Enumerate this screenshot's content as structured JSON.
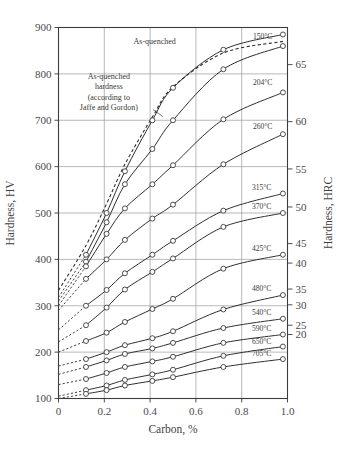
{
  "chart_data": {
    "type": "line",
    "title": "",
    "xlabel": "Carbon, %",
    "ylabel": "Hardness, HV",
    "ylabel_right": "Hardness, HRC",
    "xlim": [
      0,
      1.0
    ],
    "ylim": [
      100,
      900
    ],
    "xticks": [
      "0",
      "0.2",
      "0.4",
      "0.6",
      "0.8",
      "1.0"
    ],
    "xtick_values": [
      0,
      0.2,
      0.4,
      0.6,
      0.8,
      1.0
    ],
    "yticks": [
      "100",
      "200",
      "300",
      "400",
      "500",
      "600",
      "700",
      "800",
      "900"
    ],
    "ytick_values": [
      100,
      200,
      300,
      400,
      500,
      600,
      700,
      800,
      900
    ],
    "yticks_right": [
      "20",
      "25",
      "30",
      "35",
      "40",
      "45",
      "50",
      "55",
      "60",
      "65"
    ],
    "ytick_right_hv": [
      238,
      258,
      302,
      336,
      392,
      434,
      513,
      595,
      697,
      820
    ],
    "grid": true,
    "legend_position": "inline-right-labels",
    "annotations": [
      {
        "name": "as-quenched-top-label",
        "text": "As-quenched",
        "x": 0.42,
        "y": 865
      },
      {
        "name": "jaffe-gordon-note",
        "lines": [
          "As-quenched",
          "hardness",
          "(according to",
          "Jaffe and Gordon)"
        ],
        "x": 0.22,
        "y": 790
      }
    ],
    "series": [
      {
        "name": "As-quenched",
        "label": "As-quenched",
        "style": "solid",
        "x": [
          0.12,
          0.21,
          0.29,
          0.41,
          0.5,
          0.72,
          0.98
        ],
        "values": [
          410,
          500,
          590,
          700,
          770,
          852,
          885
        ],
        "dashed_extension_x": [
          0,
          0.12
        ],
        "dashed_extension_y": [
          318,
          410
        ]
      },
      {
        "name": "As-quenched (Jaffe and Gordon)",
        "label": "",
        "style": "dashed",
        "x": [
          0.0,
          0.12,
          0.21,
          0.29,
          0.41,
          0.5,
          0.72,
          0.98
        ],
        "values": [
          333,
          430,
          520,
          605,
          707,
          772,
          845,
          870
        ]
      },
      {
        "name": "150C",
        "label": "150°C",
        "style": "solid",
        "x": [
          0.12,
          0.21,
          0.29,
          0.41,
          0.5,
          0.72,
          0.98
        ],
        "values": [
          395,
          480,
          562,
          638,
          700,
          810,
          860
        ],
        "dashed_extension_x": [
          0,
          0.12
        ],
        "dashed_extension_y": [
          310,
          395
        ]
      },
      {
        "name": "204C",
        "label": "204°C",
        "style": "solid",
        "x": [
          0.12,
          0.21,
          0.29,
          0.41,
          0.5,
          0.72,
          0.98
        ],
        "values": [
          385,
          455,
          510,
          562,
          603,
          702,
          760
        ],
        "dashed_extension_x": [
          0,
          0.12
        ],
        "dashed_extension_y": [
          300,
          385
        ]
      },
      {
        "name": "260C",
        "label": "260°C",
        "style": "solid",
        "x": [
          0.12,
          0.21,
          0.29,
          0.41,
          0.5,
          0.72,
          0.98
        ],
        "values": [
          358,
          400,
          442,
          488,
          518,
          605,
          670
        ],
        "dashed_extension_x": [
          0,
          0.12
        ],
        "dashed_extension_y": [
          290,
          358
        ]
      },
      {
        "name": "315C",
        "label": "315°C",
        "style": "solid",
        "x": [
          0.12,
          0.21,
          0.29,
          0.41,
          0.5,
          0.72,
          0.98
        ],
        "values": [
          300,
          334,
          370,
          410,
          440,
          505,
          542
        ],
        "dashed_extension_x": [
          0,
          0.12
        ],
        "dashed_extension_y": [
          248,
          300
        ]
      },
      {
        "name": "370C",
        "label": "370°C",
        "style": "solid",
        "x": [
          0.12,
          0.21,
          0.29,
          0.41,
          0.5,
          0.72,
          0.98
        ],
        "values": [
          258,
          296,
          335,
          373,
          402,
          470,
          500
        ],
        "dashed_extension_x": [
          0,
          0.12
        ],
        "dashed_extension_y": [
          222,
          258
        ]
      },
      {
        "name": "425C",
        "label": "425°C",
        "style": "solid",
        "x": [
          0.12,
          0.21,
          0.29,
          0.41,
          0.5,
          0.72,
          0.98
        ],
        "values": [
          224,
          242,
          265,
          293,
          315,
          380,
          410
        ],
        "dashed_extension_x": [
          0,
          0.12
        ],
        "dashed_extension_y": [
          200,
          224
        ]
      },
      {
        "name": "480C",
        "label": "480°C",
        "style": "solid",
        "x": [
          0.12,
          0.21,
          0.29,
          0.41,
          0.5,
          0.72,
          0.98
        ],
        "values": [
          185,
          200,
          215,
          230,
          245,
          292,
          323
        ],
        "dashed_extension_x": [
          0,
          0.12
        ],
        "dashed_extension_y": [
          170,
          185
        ]
      },
      {
        "name": "540C",
        "label": "540°C",
        "style": "solid",
        "x": [
          0.12,
          0.21,
          0.29,
          0.41,
          0.5,
          0.72,
          0.98
        ],
        "values": [
          168,
          182,
          196,
          208,
          220,
          252,
          272
        ],
        "dashed_extension_x": [
          0,
          0.12
        ],
        "dashed_extension_y": [
          152,
          168
        ]
      },
      {
        "name": "590C",
        "label": "590°C",
        "style": "solid",
        "x": [
          0.12,
          0.21,
          0.29,
          0.41,
          0.5,
          0.72,
          0.98
        ],
        "values": [
          142,
          155,
          168,
          180,
          190,
          220,
          238
        ],
        "dashed_extension_x": [
          0,
          0.12
        ],
        "dashed_extension_y": [
          130,
          142
        ]
      },
      {
        "name": "650C",
        "label": "650°C",
        "style": "solid",
        "x": [
          0.12,
          0.21,
          0.29,
          0.41,
          0.5,
          0.72,
          0.98
        ],
        "values": [
          118,
          128,
          140,
          152,
          162,
          192,
          212
        ],
        "dashed_extension_x": [
          0,
          0.12
        ],
        "dashed_extension_y": [
          105,
          118
        ]
      },
      {
        "name": "705C",
        "label": "705°C",
        "style": "solid",
        "x": [
          0.12,
          0.21,
          0.29,
          0.41,
          0.5,
          0.72,
          0.98
        ],
        "values": [
          110,
          118,
          128,
          138,
          146,
          168,
          185
        ],
        "dashed_extension_x": [
          0,
          0.12
        ],
        "dashed_extension_y": [
          100,
          110
        ]
      }
    ]
  }
}
